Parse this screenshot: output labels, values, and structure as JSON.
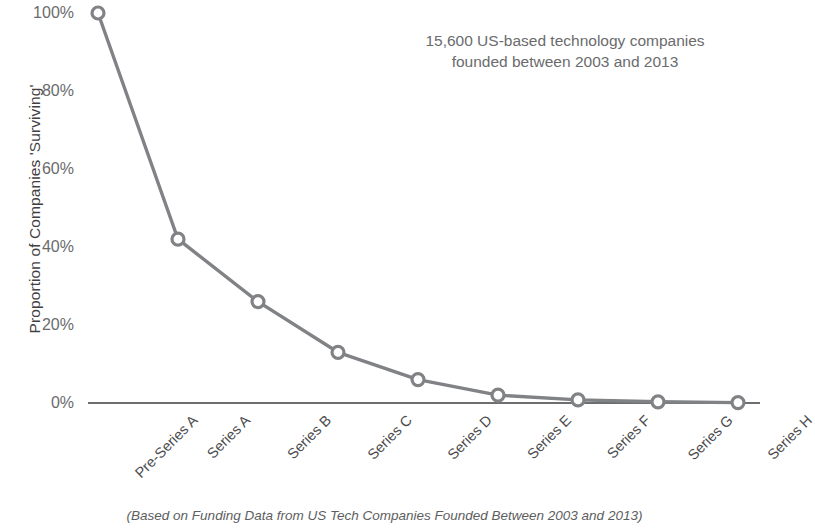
{
  "chart_data": {
    "type": "line",
    "title": "",
    "subtitle": "",
    "xlabel": "",
    "ylabel": "Proportion of Companies 'Surviving'",
    "categories": [
      "Pre-Series A",
      "Series A",
      "Series B",
      "Series C",
      "Series D",
      "Series E",
      "Series F",
      "Series G",
      "Series H"
    ],
    "values": [
      100,
      42,
      26,
      13,
      6,
      2,
      0.8,
      0.3,
      0.1
    ],
    "value_labels": [
      "100%",
      "42%",
      "26%",
      "13%",
      "6%",
      "2%",
      "0.8%",
      "0.3%",
      "0.1%"
    ],
    "ylim": [
      0,
      100
    ],
    "y_ticks": [
      0,
      20,
      40,
      60,
      80,
      100
    ],
    "y_tick_labels": [
      "0%",
      "20%",
      "40%",
      "60%",
      "80%",
      "100%"
    ],
    "grid": false,
    "legend": "none",
    "marker": "open-circle",
    "series_color": "#808285",
    "axis_color": "#6d6e70",
    "annotations": [
      {
        "name": "sample-note",
        "lines": [
          "15,600 US-based technology companies",
          "founded between 2003 and 2013"
        ]
      }
    ],
    "caption": "(Based on Funding Data from US Tech Companies Founded Between 2003 and 2013)"
  },
  "colors": {
    "line": "#808285",
    "marker_stroke": "#7a7c7e",
    "axis": "#6d6e70",
    "text": "#58595b",
    "annotation_text": "#6a6b6d"
  }
}
